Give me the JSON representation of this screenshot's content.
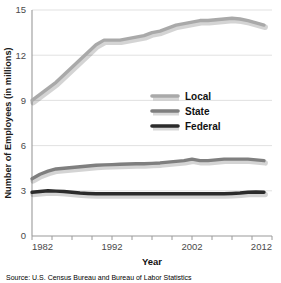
{
  "chart_data": {
    "type": "line",
    "title": "",
    "xlabel": "Year",
    "ylabel": "Number of Employees (in millions)",
    "xlim": [
      1982,
      2012
    ],
    "ylim": [
      0,
      15
    ],
    "yticks": [
      0,
      3,
      6,
      9,
      12,
      15
    ],
    "ytick_labels": [
      "0",
      "3",
      "6",
      "9",
      "12",
      "15"
    ],
    "xticks": [
      1982,
      1992,
      2002,
      2012
    ],
    "xtick_labels": [
      "1982",
      "1992",
      "2002",
      "2012"
    ],
    "x_minor_tick_interval": 2.5,
    "grid": "horizontal",
    "legend_position": "center-right",
    "x": [
      1982,
      1983,
      1984,
      1985,
      1986,
      1987,
      1988,
      1989,
      1990,
      1991,
      1992,
      1993,
      1994,
      1995,
      1996,
      1997,
      1998,
      1999,
      2000,
      2001,
      2002,
      2003,
      2004,
      2005,
      2006,
      2007,
      2008,
      2009,
      2010,
      2011
    ],
    "series": [
      {
        "name": "Local",
        "color": "#a9a9a9",
        "values": [
          9.0,
          9.4,
          9.8,
          10.2,
          10.7,
          11.2,
          11.7,
          12.2,
          12.7,
          13.0,
          13.0,
          13.0,
          13.1,
          13.2,
          13.3,
          13.5,
          13.6,
          13.8,
          14.0,
          14.1,
          14.2,
          14.3,
          14.3,
          14.35,
          14.4,
          14.45,
          14.4,
          14.3,
          14.15,
          14.0
        ]
      },
      {
        "name": "State",
        "color": "#7f7f7f",
        "values": [
          3.8,
          4.1,
          4.3,
          4.45,
          4.5,
          4.55,
          4.6,
          4.65,
          4.7,
          4.72,
          4.74,
          4.76,
          4.78,
          4.8,
          4.8,
          4.82,
          4.85,
          4.9,
          4.95,
          5.0,
          5.1,
          5.0,
          5.0,
          5.05,
          5.1,
          5.1,
          5.1,
          5.1,
          5.05,
          5.0
        ]
      },
      {
        "name": "Federal",
        "color": "#2b2b2b",
        "values": [
          2.9,
          2.95,
          3.0,
          2.98,
          2.95,
          2.9,
          2.85,
          2.82,
          2.8,
          2.8,
          2.8,
          2.8,
          2.8,
          2.8,
          2.8,
          2.8,
          2.8,
          2.8,
          2.8,
          2.8,
          2.8,
          2.8,
          2.8,
          2.8,
          2.8,
          2.82,
          2.85,
          2.9,
          2.92,
          2.9
        ]
      }
    ]
  },
  "legend": {
    "items": [
      {
        "label": "Local",
        "color": "#a9a9a9"
      },
      {
        "label": "State",
        "color": "#7f7f7f"
      },
      {
        "label": "Federal",
        "color": "#2b2b2b"
      }
    ]
  },
  "axis": {
    "x_title": "Year",
    "y_title": "Number of Employees (in millions)"
  },
  "source": {
    "text": "Source: U.S. Census Bureau and Bureau of Labor Statistics"
  }
}
